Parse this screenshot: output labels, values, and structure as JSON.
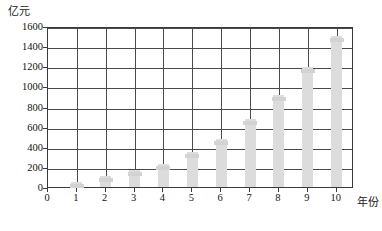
{
  "chart_data": {
    "type": "bar",
    "title": "",
    "subtitle": "",
    "xlabel": "年份",
    "ylabel": "亿元",
    "categories": [
      "1",
      "2",
      "3",
      "4",
      "5",
      "6",
      "7",
      "8",
      "9",
      "10"
    ],
    "values": [
      50,
      110,
      170,
      230,
      350,
      480,
      680,
      910,
      1190,
      1500
    ],
    "x_tick_labels": [
      "0",
      "1",
      "2",
      "3",
      "4",
      "5",
      "6",
      "7",
      "8",
      "9",
      "10"
    ],
    "y_tick_labels": [
      "0",
      "200",
      "400",
      "600",
      "800",
      "1000",
      "1200",
      "1400",
      "1600"
    ],
    "y_tick_values": [
      0,
      200,
      400,
      600,
      800,
      1000,
      1200,
      1400,
      1600
    ],
    "ylim": [
      0,
      1600
    ],
    "xlim": [
      0,
      10.6
    ],
    "grid": true,
    "legend": null,
    "bar_color": "#dcdcdc",
    "axis_color": "#3a3a3a",
    "grid_color": "#4a4a4a",
    "text_color": "#111111"
  },
  "axes": {
    "y_unit_label": "亿元",
    "x_name_label": "年份"
  }
}
